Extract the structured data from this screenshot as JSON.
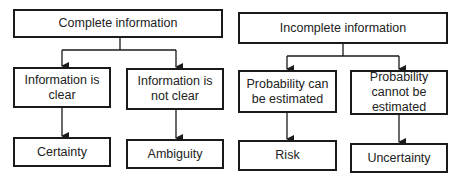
{
  "diagram": {
    "left": {
      "root": "Complete information",
      "children": [
        {
          "label": "Information is clear",
          "leaf": "Certainty"
        },
        {
          "label": "Information is not clear",
          "leaf": "Ambiguity"
        }
      ]
    },
    "right": {
      "root": "Incomplete information",
      "children": [
        {
          "label": "Probability can be estimated",
          "leaf": "Risk"
        },
        {
          "label": "Probability cannot be estimated",
          "leaf": "Uncertainty"
        }
      ]
    },
    "colors": {
      "stroke": "#1a1a1a",
      "fill": "#ffffff",
      "text": "#222222"
    }
  }
}
